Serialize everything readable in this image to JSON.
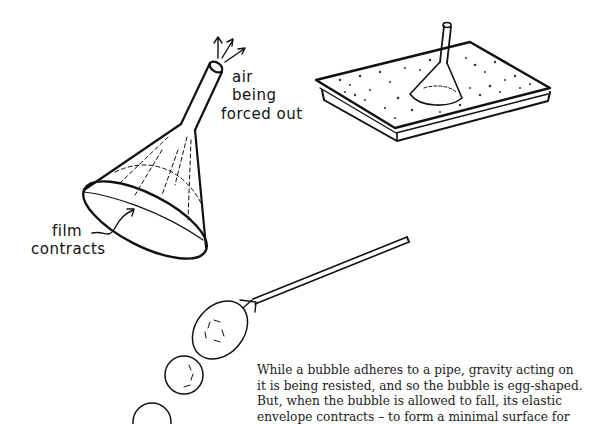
{
  "illustration": {
    "funnel_labels": {
      "air_line1": "air",
      "air_line2": "being",
      "air_line3": "forced out",
      "film_line1": "film",
      "film_line2": "contracts"
    }
  },
  "caption": {
    "lines": [
      "While a bubble adheres to a pipe, gravity acting on",
      "it is being resisted, and so the bubble is egg-shaped.",
      "But, when the bubble is allowed to fall, its elastic",
      "envelope contracts – to form a minimal surface for"
    ]
  }
}
